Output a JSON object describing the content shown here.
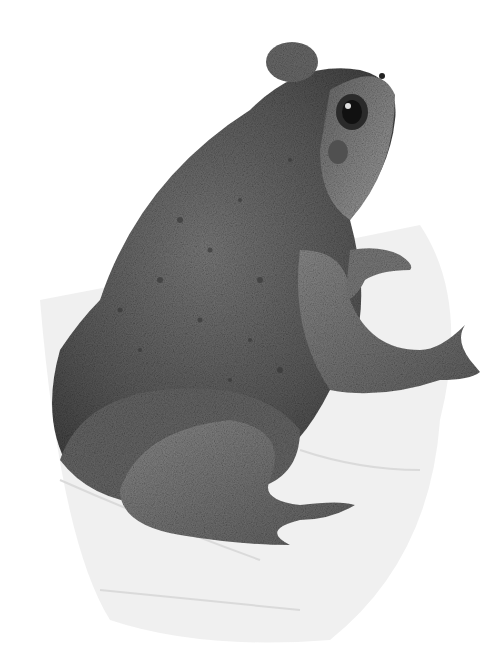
{
  "image": {
    "subject": "toad",
    "style": "pencil drawing",
    "background": "#ffffff",
    "colors": {
      "body_dark": "#4a4a4a",
      "body_mid": "#6e6e6e",
      "body_light": "#9a9a9a",
      "ground": "#d8d8d8",
      "eye": "#1a1a1a"
    }
  }
}
